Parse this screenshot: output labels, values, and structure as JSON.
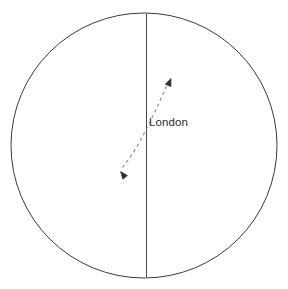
{
  "figure": {
    "background_color": "#ffffff",
    "stroke_color": "#3a3a3a",
    "dash_color": "#7a7a7a",
    "text_color": "#2b2b2b",
    "width": 288,
    "height": 289
  },
  "globe": {
    "name": "earth-outline-circle",
    "center_x": 144,
    "center_y": 145.5,
    "radius_x": 133,
    "radius_y": 132.5,
    "stroke_width": 1
  },
  "meridian": {
    "name": "prime-meridian-line",
    "x": 146.5,
    "y_top": 14,
    "y_bottom": 277,
    "stroke_width": 1
  },
  "labels": {
    "city": "London",
    "city_x": 149,
    "city_y": 126
  },
  "arrow_curve": {
    "name": "double-headed-curved-arrow",
    "dash_pattern": "3 3",
    "stroke_width": 1,
    "start_point": {
      "x": 120,
      "y": 171
    },
    "end_point": {
      "x": 170,
      "y": 79
    },
    "control_1": {
      "x": 139,
      "y": 147
    },
    "control_2": {
      "x": 152,
      "y": 119
    },
    "arrowheads": [
      {
        "name": "arrowhead-lower-left",
        "x": 120,
        "y": 171,
        "rotation": 232
      },
      {
        "name": "arrowhead-upper-right",
        "x": 170.5,
        "y": 79,
        "rotation": 36
      }
    ]
  }
}
